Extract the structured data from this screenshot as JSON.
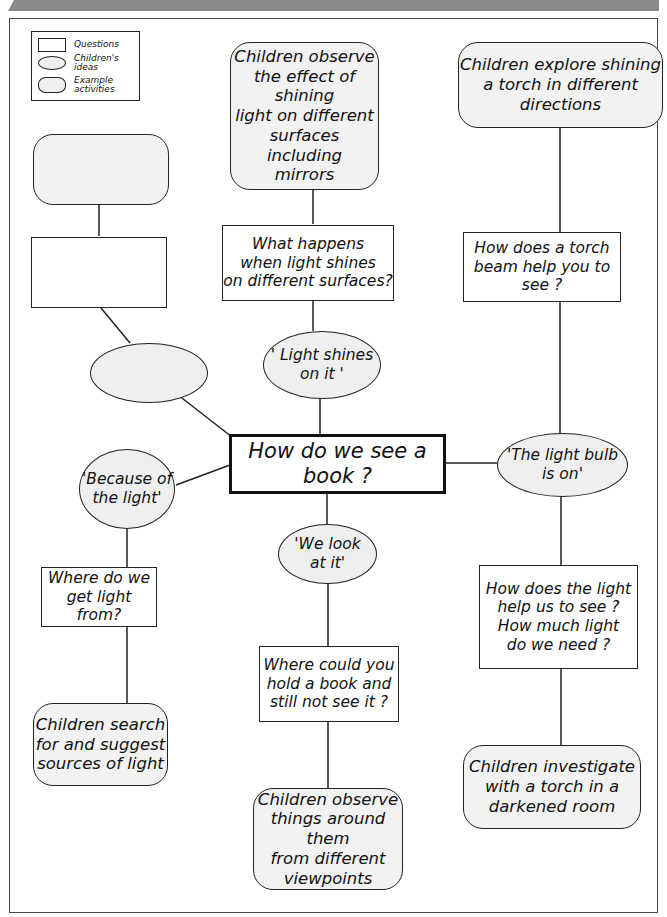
{
  "legend": {
    "items": [
      {
        "shape": "rectangle",
        "label": "Questions"
      },
      {
        "shape": "ellipse",
        "label": "Children's\nideas"
      },
      {
        "shape": "rounded-rectangle",
        "label": "Example\nactivities"
      }
    ]
  },
  "central": {
    "label": "How do we see a book ?"
  },
  "branches": {
    "top_left": {
      "activity": {
        "label": ""
      },
      "question": {
        "label": ""
      },
      "idea": {
        "label": ""
      }
    },
    "top_center": {
      "activity": {
        "label": "Children observe\nthe effect of\nshining\nlight on different\nsurfaces including\nmirrors"
      },
      "question": {
        "label": "What happens\nwhen light shines\non different surfaces?"
      },
      "idea": {
        "label": "' Light shines\non it '"
      }
    },
    "right": {
      "activity_top": {
        "label": "Children explore shining\na torch in different\ndirections"
      },
      "question_top": {
        "label": "How does a torch\nbeam help you to\nsee ?"
      },
      "idea": {
        "label": "'The light bulb\nis on'"
      },
      "question_bottom": {
        "label": "How does the light\nhelp us to see ?\nHow much light\ndo we need ?"
      },
      "activity_bottom": {
        "label": "Children investigate\nwith a torch in a\ndarkened room"
      }
    },
    "left": {
      "idea": {
        "label": "'Because of\nthe light'"
      },
      "question": {
        "label": "Where do we\nget light from?"
      },
      "activity": {
        "label": "Children search\nfor and suggest\nsources of light"
      }
    },
    "bottom_center": {
      "idea": {
        "label": "'We look\nat it'"
      },
      "question": {
        "label": "Where could you\nhold a book and\nstill not see it ?"
      },
      "activity": {
        "label": "Children observe\nthings around them\nfrom different\nviewpoints"
      }
    }
  },
  "colors": {
    "activity_fill": "#f2f2f2",
    "idea_fill": "#efefef",
    "line": "#222222",
    "band": "#8a8a8a"
  }
}
